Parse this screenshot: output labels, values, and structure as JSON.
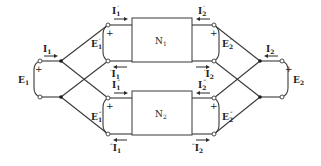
{
  "diagram": {
    "type": "two-port parallel interconnection",
    "networks": [
      {
        "id": "N1",
        "label": "N",
        "sub": "1"
      },
      {
        "id": "N2",
        "label": "N",
        "sub": "2"
      }
    ],
    "ports": {
      "E1": {
        "label": "E",
        "sub": "1",
        "polarity": "+"
      },
      "E2": {
        "label": "E",
        "sub": "2",
        "polarity": "+"
      },
      "E1p": {
        "label": "E",
        "sub": "1",
        "prime": "′",
        "polarity": "+"
      },
      "E2p": {
        "label": "E",
        "sub": "2",
        "prime": "′",
        "polarity": "+"
      },
      "E1pp": {
        "label": "E",
        "sub": "1",
        "prime": "″",
        "polarity": "+"
      },
      "E2pp": {
        "label": "E",
        "sub": "2",
        "prime": "″",
        "polarity": "+"
      }
    },
    "currents": {
      "I1": {
        "label": "I",
        "sub": "1"
      },
      "I2": {
        "label": "I",
        "sub": "2"
      },
      "I1p": {
        "label": "I",
        "sub": "1",
        "prime": "′"
      },
      "I2p": {
        "label": "I",
        "sub": "2",
        "prime": "′"
      },
      "I1pp": {
        "label": "I",
        "sub": "1",
        "prime": "″"
      },
      "I2pp": {
        "label": "I",
        "sub": "2",
        "prime": "″"
      },
      "I1p_ret": {
        "label": "I",
        "sub": "1",
        "prefix": "′"
      },
      "I2p_ret": {
        "label": "I",
        "sub": "2",
        "prefix": "′"
      },
      "I1pp_ret": {
        "label": "I",
        "sub": "1",
        "prefix": "″"
      },
      "I2pp_ret": {
        "label": "I",
        "sub": "2",
        "prefix": "″"
      }
    },
    "plus_sign": "+"
  }
}
